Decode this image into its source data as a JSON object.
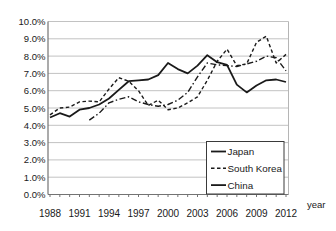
{
  "chart_data": {
    "type": "line",
    "title": "",
    "xlabel": "year",
    "ylabel": "",
    "ylim": [
      0,
      10
    ],
    "grid": "horizontal",
    "legend_position": "bottom-right",
    "y_tick_labels": [
      "10.0%",
      "9.0%",
      "8.0%",
      "7.0%",
      "6.0%",
      "5.0%",
      "4.0%",
      "3.0%",
      "2.0%",
      "1.0%",
      "0.0%"
    ],
    "x_tick_labels": [
      "1988",
      "1991",
      "1994",
      "1997",
      "2000",
      "2003",
      "2006",
      "2009",
      "2012"
    ],
    "x_range": [
      1988,
      2012
    ],
    "colors": {
      "line": "#1a1a1a",
      "grid": "#c2c2c2",
      "axis": "#737373",
      "border": "#b5b5b5",
      "text": "#1a1a1a",
      "background": "#ffffff"
    },
    "series": [
      {
        "name": "Japan",
        "line_style": "solid",
        "legend_key": "solid",
        "start_year": 1988,
        "values": [
          4.45,
          4.7,
          4.5,
          4.9,
          5.0,
          5.2,
          5.55,
          6.05,
          6.55,
          6.6,
          6.65,
          6.9,
          7.6,
          7.25,
          7.0,
          7.45,
          8.05,
          7.65,
          7.5,
          6.35,
          5.9,
          6.3,
          6.6,
          6.65,
          6.5
        ]
      },
      {
        "name": "South Korea",
        "line_style": "dashed",
        "legend_key": "dashed",
        "start_year": 1988,
        "values": [
          4.6,
          5.0,
          5.05,
          5.35,
          5.4,
          5.35,
          6.1,
          6.75,
          6.55,
          6.0,
          5.15,
          5.45,
          4.9,
          5.0,
          5.3,
          5.65,
          6.6,
          7.7,
          8.4,
          7.45,
          7.55,
          8.8,
          9.15,
          7.6,
          8.1
        ]
      },
      {
        "name": "China",
        "line_style": "dashdot",
        "legend_key": "solid",
        "start_year": 1992,
        "values": [
          4.3,
          4.7,
          5.3,
          5.5,
          5.65,
          5.35,
          5.2,
          5.1,
          5.2,
          5.45,
          5.9,
          6.8,
          7.6,
          7.5,
          7.45,
          7.4,
          7.55,
          7.7,
          8.0,
          7.9,
          7.15
        ]
      }
    ]
  }
}
